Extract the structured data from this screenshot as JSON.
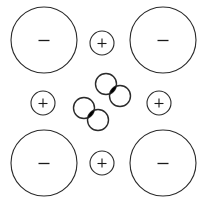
{
  "figure": {
    "background_color": "#ffffff",
    "stroke_color": "#2b2b2b",
    "fill_color": "#000000",
    "width": 203,
    "height": 204
  },
  "chart_data": {
    "type": "scatter",
    "title": "",
    "xlabel": "",
    "ylabel": "",
    "grid": false,
    "legend": null,
    "xlim": [
      0,
      203
    ],
    "ylim": [
      0,
      204
    ],
    "series": [
      {
        "name": "negative-large-circles",
        "label": "-",
        "radius": 33,
        "values": [
          {
            "id": "neg-top-left",
            "x": 44,
            "y": 40,
            "label": "-"
          },
          {
            "id": "neg-top-right",
            "x": 163,
            "y": 40,
            "label": "-"
          },
          {
            "id": "neg-bottom-left",
            "x": 44,
            "y": 163,
            "label": "-"
          },
          {
            "id": "neg-bottom-right",
            "x": 163,
            "y": 163,
            "label": "-"
          }
        ]
      },
      {
        "name": "positive-small-circles",
        "label": "+",
        "radius": 12,
        "values": [
          {
            "id": "pos-top-center",
            "x": 102,
            "y": 43,
            "label": "+"
          },
          {
            "id": "pos-middle-left",
            "x": 43,
            "y": 103,
            "label": "+"
          },
          {
            "id": "pos-middle-right",
            "x": 159,
            "y": 103,
            "label": "+"
          },
          {
            "id": "pos-bottom-center",
            "x": 102,
            "y": 163,
            "label": "+"
          }
        ]
      },
      {
        "name": "cluster-overlapping-circles",
        "label": "",
        "radius": 10.5,
        "values": [
          {
            "id": "cluster-a-upper",
            "x": 106,
            "y": 84,
            "label": ""
          },
          {
            "id": "cluster-a-lower",
            "x": 120,
            "y": 96,
            "label": ""
          },
          {
            "id": "cluster-b-upper",
            "x": 84,
            "y": 108,
            "label": ""
          },
          {
            "id": "cluster-b-lower",
            "x": 98,
            "y": 120,
            "label": ""
          }
        ]
      },
      {
        "name": "cluster-intersection-fills",
        "label": "",
        "values": [
          {
            "id": "lens-a",
            "x": 112.5,
            "y": 90.5,
            "label": ""
          },
          {
            "id": "lens-b",
            "x": 90.5,
            "y": 114.5,
            "label": ""
          }
        ]
      }
    ]
  },
  "nodes": {
    "negative": [
      {
        "name": "negative-node-top-left",
        "sign": "-",
        "cx": 44,
        "cy": 40,
        "r": 33
      },
      {
        "name": "negative-node-top-right",
        "sign": "-",
        "cx": 163,
        "cy": 40,
        "r": 33
      },
      {
        "name": "negative-node-bottom-left",
        "sign": "-",
        "cx": 44,
        "cy": 163,
        "r": 33
      },
      {
        "name": "negative-node-bottom-right",
        "sign": "-",
        "cx": 163,
        "cy": 163,
        "r": 33
      }
    ],
    "positive": [
      {
        "name": "positive-node-top-center",
        "sign": "+",
        "cx": 102,
        "cy": 43,
        "r": 12
      },
      {
        "name": "positive-node-middle-left",
        "sign": "+",
        "cx": 43,
        "cy": 103,
        "r": 12
      },
      {
        "name": "positive-node-middle-right",
        "sign": "+",
        "cx": 159,
        "cy": 103,
        "r": 12
      },
      {
        "name": "positive-node-bottom-center",
        "sign": "+",
        "cx": 102,
        "cy": 163,
        "r": 12
      }
    ],
    "cluster": [
      {
        "name": "cluster-circle-a-upper",
        "cx": 106,
        "cy": 84,
        "r": 10.5
      },
      {
        "name": "cluster-circle-a-lower",
        "cx": 120,
        "cy": 96,
        "r": 10.5
      },
      {
        "name": "cluster-circle-b-upper",
        "cx": 84,
        "cy": 108,
        "r": 10.5
      },
      {
        "name": "cluster-circle-b-lower",
        "cx": 98,
        "cy": 120,
        "r": 10.5
      }
    ]
  },
  "labels": {
    "minus": "-",
    "plus": "+"
  }
}
